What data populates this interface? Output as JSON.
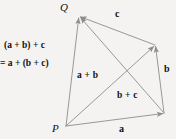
{
  "figure": {
    "kind": "vector-addition-associativity-diagram",
    "background_color": "#f4f3f1",
    "stroke_color": "#8d8d8d",
    "text_color": "#111111",
    "width": 176,
    "height": 139
  },
  "points": {
    "p_label": "P",
    "q_label": "Q"
  },
  "edge_labels": {
    "a": "a",
    "b": "b",
    "c": "c"
  },
  "diagonal_labels": {
    "a_plus_b": "a + b",
    "b_plus_c": "b + c"
  },
  "expression": {
    "line1": "(a + b) + c",
    "line2": "= a + (b + c)"
  },
  "geometry": {
    "vertices": {
      "P": [
        66,
        126
      ],
      "Q": [
        79,
        16
      ],
      "R": [
        155,
        45
      ],
      "S": [
        164,
        113
      ]
    },
    "vectors": [
      {
        "name": "a",
        "from": "P",
        "to": "S"
      },
      {
        "name": "b",
        "from": "S",
        "to": "R"
      },
      {
        "name": "c",
        "from": "R",
        "to": "Q"
      },
      {
        "name": "a + b",
        "from": "P",
        "to": "R"
      },
      {
        "name": "b + c",
        "from": "S",
        "to": "Q"
      },
      {
        "name": "(a + b) + c = a + (b + c)",
        "from": "P",
        "to": "Q"
      }
    ]
  }
}
